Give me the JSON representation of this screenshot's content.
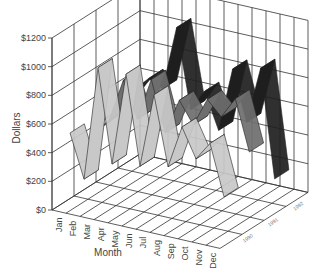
{
  "chart_data": {
    "type": "line",
    "subtype": "3d-ribbon",
    "title": "",
    "xlabel": "Month",
    "ylabel": "Dollars",
    "categories": [
      "Jan",
      "Feb",
      "Mar",
      "Apr",
      "May",
      "Jun",
      "Jul",
      "Aug",
      "Sep",
      "Oct",
      "Nov",
      "Dec"
    ],
    "yticks": [
      "$0",
      "$200",
      "$400",
      "$600",
      "$800",
      "$1000",
      "$1200"
    ],
    "ylim": [
      0,
      1200
    ],
    "depth_labels": [
      "1990",
      "1991",
      "1992"
    ],
    "grid": true,
    "legend": "none",
    "series": [
      {
        "name": "1990",
        "color": "#c8c8c8",
        "values": [
          500,
          200,
          1000,
          350,
          1000,
          380,
          900,
          420,
          720,
          520,
          650,
          300
        ]
      },
      {
        "name": "1991",
        "color": "#6e6e6e",
        "values": [
          400,
          500,
          800,
          550,
          850,
          500,
          750,
          600,
          800,
          700,
          850,
          500
        ]
      },
      {
        "name": "1992",
        "color": "#1e1e1e",
        "values": [
          450,
          600,
          700,
          650,
          1100,
          550,
          700,
          450,
          900,
          550,
          950,
          200
        ]
      }
    ]
  }
}
